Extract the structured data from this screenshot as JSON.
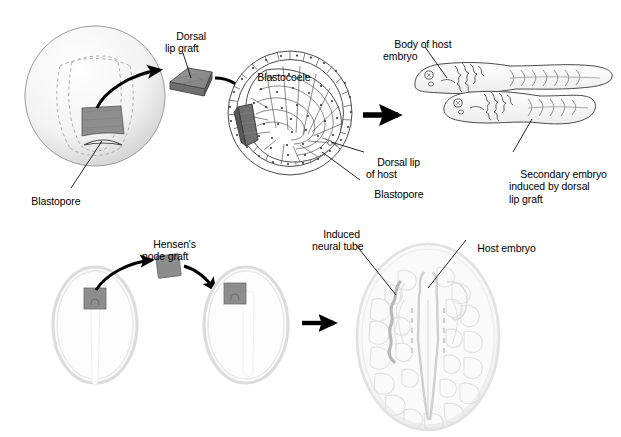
{
  "figure": {
    "width": 621,
    "height": 437,
    "background": "#ffffff"
  },
  "colors": {
    "graft_fill": "#8d8d8d",
    "graft_fill_dark": "#6f6f6f",
    "graft_stroke": "#3a3a3a",
    "outline": "#3c3c3c",
    "arrow": "#000000",
    "embryo_fill": "#f4f4f4",
    "embryo_shade": "#d9d9d9",
    "cell_stroke": "#4a4a4a",
    "dashed_line": "#9a9a9a",
    "chick_glow": "#ebebeb",
    "label_text": "#000000"
  },
  "panels": [
    {
      "id": "amphibian-experiment",
      "name": "Amphibian dorsal lip graft",
      "organism": "amphibian",
      "stages": [
        {
          "id": "donor-gastrula",
          "name": "Donor gastrula with blastopore"
        },
        {
          "id": "excised-graft",
          "name": "Excised dorsal lip graft"
        },
        {
          "id": "host-gastrula-section",
          "name": "Host gastrula section with graft implanted"
        },
        {
          "id": "double-embryo",
          "name": "Host embryo with induced secondary embryo"
        }
      ]
    },
    {
      "id": "chick-experiment",
      "name": "Chick Hensen's node graft",
      "organism": "chick",
      "stages": [
        {
          "id": "donor-blastoderm",
          "name": "Donor blastoderm with Hensen's node"
        },
        {
          "id": "excised-node",
          "name": "Excised Hensen's node graft"
        },
        {
          "id": "host-blastoderm",
          "name": "Host blastoderm with node graft implanted"
        },
        {
          "id": "induced-result",
          "name": "Host blastoderm with induced neural tube"
        }
      ]
    }
  ],
  "labels": {
    "top": {
      "dorsal_lip_graft": "Dorsal\nlip graft",
      "blastocoele": "Blastocoele",
      "blastopore_donor": "Blastopore",
      "dorsal_lip_of_host": "Dorsal lip\nof host",
      "blastopore_host": "Blastopore",
      "body_of_host_embryo": "Body of host\nembryo",
      "secondary_embryo": "Secondary embryo\ninduced by dorsal\nlip graft"
    },
    "bottom": {
      "hensens_node_graft": "Hensen's\nnode graft",
      "induced_neural_tube": "Induced\nneural tube",
      "host_embryo": "Host embryo"
    }
  },
  "arrows": [
    {
      "id": "arrow-donor-to-graft",
      "name": "curved arrow donor lip to graft",
      "style": "curved"
    },
    {
      "id": "arrow-graft-to-host",
      "name": "curved arrow graft to host gastrula",
      "style": "curved"
    },
    {
      "id": "arrow-gastrula-to-tadpole",
      "name": "straight arrow gastrula to tadpoles",
      "style": "straight"
    },
    {
      "id": "arrow-node-out",
      "name": "curved arrow node to graft",
      "style": "curved"
    },
    {
      "id": "arrow-node-in",
      "name": "curved arrow graft to host blastoderm",
      "style": "curved"
    },
    {
      "id": "arrow-blastoderm-to-result",
      "name": "straight arrow host blastoderm to result",
      "style": "straight"
    }
  ],
  "icons": {
    "graft_block": "graft-block-icon",
    "arrow_head": "arrowhead-icon"
  }
}
